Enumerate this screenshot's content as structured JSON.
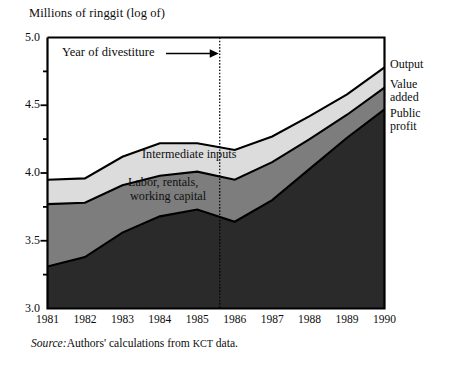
{
  "figure": {
    "y_axis_title": "Millions of ringgit (log of)",
    "source_prefix": "Source:",
    "source_text": "Authors' calculations from ",
    "source_acronym": "KCT",
    "source_suffix": " data.",
    "annotation": "Year of divestiture"
  },
  "legend": {
    "items": [
      {
        "label": "Output",
        "color": "#ffffff"
      },
      {
        "label": "Value\nadded",
        "line1": "Value",
        "line2": "added",
        "color": "#dcdcdc"
      },
      {
        "label": "Public\nprofit",
        "line1": "Public",
        "line2": "profit",
        "color": "#2a2a2a"
      }
    ]
  },
  "band_labels": {
    "intermediate": "Intermediate inputs",
    "labor_line1": "Labor, rentals,",
    "labor_line2": "working capital"
  },
  "colors": {
    "output_band": "#ffffff",
    "intermediate_band": "#dcdcdc",
    "labor_band": "#7d7d7d",
    "public_profit_band": "#2a2a2a",
    "axis": "#000000",
    "divestiture_line": "#000000"
  },
  "chart_data": {
    "type": "area",
    "title": "",
    "xlabel": "",
    "ylabel": "Millions of ringgit (log of)",
    "ylim": [
      3.0,
      5.0
    ],
    "y_ticks_major": [
      "3.0",
      "3.5",
      "4.0",
      "4.5",
      "5.0"
    ],
    "y_ticks_major_values": [
      3.0,
      3.5,
      4.0,
      4.5,
      5.0
    ],
    "y_ticks_minor_values": [
      3.25,
      3.75,
      4.25,
      4.75
    ],
    "grid": false,
    "legend_position": "right",
    "categories": [
      "1981",
      "1982",
      "1983",
      "1984",
      "1985",
      "1986",
      "1987",
      "1988",
      "1989",
      "1990"
    ],
    "x": [
      1981,
      1982,
      1983,
      1984,
      1985,
      1986,
      1987,
      1988,
      1989,
      1990
    ],
    "stacked": true,
    "series": [
      {
        "name": "Public profit",
        "values": [
          3.31,
          3.38,
          3.56,
          3.68,
          3.73,
          3.64,
          3.8,
          4.03,
          4.26,
          4.47
        ]
      },
      {
        "name": "Labor, rentals, working capital",
        "cumulative_top": [
          3.77,
          3.78,
          3.91,
          3.98,
          4.01,
          3.95,
          4.08,
          4.25,
          4.43,
          4.63
        ]
      },
      {
        "name": "Intermediate inputs",
        "cumulative_top": [
          3.95,
          3.96,
          4.12,
          4.22,
          4.22,
          4.17,
          4.27,
          4.42,
          4.58,
          4.78
        ]
      }
    ],
    "total_output": [
      3.95,
      3.96,
      4.12,
      4.22,
      4.22,
      4.17,
      4.27,
      4.42,
      4.58,
      4.78
    ],
    "annotations": [
      {
        "text": "Year of divestiture",
        "x": 1985.6,
        "type": "vertical-dotted-line-with-arrow"
      }
    ]
  }
}
